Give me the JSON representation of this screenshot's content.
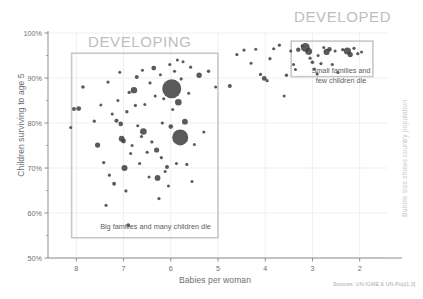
{
  "chart_data": {
    "type": "scatter",
    "title": "",
    "xlabel": "Babies per woman",
    "ylabel": "Children surviving to age 5",
    "xlim": [
      8.6,
      1.4
    ],
    "ylim": [
      50,
      100
    ],
    "x_ticks": [
      "8",
      "7",
      "6",
      "5",
      "4",
      "3",
      "2"
    ],
    "x_tick_values": [
      8,
      7,
      6,
      5,
      4,
      3,
      2
    ],
    "y_ticks": [
      "50%",
      "60%",
      "70%",
      "80%",
      "90%",
      "100%"
    ],
    "y_tick_values": [
      50,
      60,
      70,
      80,
      90,
      100
    ],
    "y_minor_tick_values": [
      55,
      65,
      75,
      85,
      95
    ],
    "x_axis_inverted": true,
    "grid": "light vertical and horizontal gridlines at major ticks",
    "legend": "none",
    "bubble_encoding": "Bubble size shows country population",
    "bubble_color": "#3f3f41",
    "annotations": [
      {
        "name": "developing",
        "heading": "DEVELOPING",
        "caption": "Big families and many children die",
        "box_x_range": [
          8.1,
          5.0
        ],
        "box_y_range": [
          54.5,
          95.5
        ]
      },
      {
        "name": "developed",
        "heading": "DEVELOPED",
        "caption_line1": "Small families and",
        "caption_line2": "few children die",
        "box_x_range": [
          3.45,
          1.72
        ],
        "box_y_range": [
          90.3,
          98.2
        ]
      }
    ],
    "points": [
      {
        "x": 8.05,
        "y": 83.1,
        "r": 2.0
      },
      {
        "x": 8.12,
        "y": 79.0,
        "r": 1.5
      },
      {
        "x": 7.95,
        "y": 83.2,
        "r": 2.4
      },
      {
        "x": 7.86,
        "y": 88.0,
        "r": 1.8
      },
      {
        "x": 7.62,
        "y": 80.4,
        "r": 1.6
      },
      {
        "x": 7.55,
        "y": 75.1,
        "r": 2.6
      },
      {
        "x": 7.48,
        "y": 84.0,
        "r": 1.5
      },
      {
        "x": 7.42,
        "y": 71.2,
        "r": 1.6
      },
      {
        "x": 7.37,
        "y": 61.7,
        "r": 1.6
      },
      {
        "x": 7.33,
        "y": 89.1,
        "r": 1.6
      },
      {
        "x": 7.3,
        "y": 68.4,
        "r": 1.6
      },
      {
        "x": 7.24,
        "y": 82.0,
        "r": 1.5
      },
      {
        "x": 7.2,
        "y": 66.5,
        "r": 1.9
      },
      {
        "x": 7.15,
        "y": 80.5,
        "r": 2.1
      },
      {
        "x": 7.12,
        "y": 85.0,
        "r": 1.5
      },
      {
        "x": 7.08,
        "y": 91.3,
        "r": 1.5
      },
      {
        "x": 7.06,
        "y": 79.8,
        "r": 2.3
      },
      {
        "x": 7.04,
        "y": 76.5,
        "r": 2.9
      },
      {
        "x": 7.0,
        "y": 76.0,
        "r": 2.4
      },
      {
        "x": 6.98,
        "y": 70.0,
        "r": 3.0
      },
      {
        "x": 6.95,
        "y": 64.9,
        "r": 1.6
      },
      {
        "x": 6.93,
        "y": 82.5,
        "r": 1.7
      },
      {
        "x": 6.9,
        "y": 57.3,
        "r": 1.9
      },
      {
        "x": 6.88,
        "y": 86.8,
        "r": 1.7
      },
      {
        "x": 6.85,
        "y": 73.2,
        "r": 1.5
      },
      {
        "x": 6.82,
        "y": 75.0,
        "r": 1.5
      },
      {
        "x": 6.78,
        "y": 87.3,
        "r": 3.2
      },
      {
        "x": 6.75,
        "y": 83.9,
        "r": 1.6
      },
      {
        "x": 6.72,
        "y": 90.2,
        "r": 2.0
      },
      {
        "x": 6.7,
        "y": 79.4,
        "r": 1.5
      },
      {
        "x": 6.66,
        "y": 71.0,
        "r": 1.6
      },
      {
        "x": 6.62,
        "y": 77.0,
        "r": 1.6
      },
      {
        "x": 6.6,
        "y": 91.7,
        "r": 1.5
      },
      {
        "x": 6.58,
        "y": 78.1,
        "r": 3.3
      },
      {
        "x": 6.55,
        "y": 84.1,
        "r": 1.5
      },
      {
        "x": 6.5,
        "y": 73.5,
        "r": 1.6
      },
      {
        "x": 6.46,
        "y": 68.0,
        "r": 1.5
      },
      {
        "x": 6.44,
        "y": 88.9,
        "r": 1.6
      },
      {
        "x": 6.4,
        "y": 75.8,
        "r": 1.6
      },
      {
        "x": 6.36,
        "y": 92.2,
        "r": 2.4
      },
      {
        "x": 6.33,
        "y": 86.0,
        "r": 1.5
      },
      {
        "x": 6.3,
        "y": 74.0,
        "r": 2.6
      },
      {
        "x": 6.28,
        "y": 67.8,
        "r": 2.9
      },
      {
        "x": 6.25,
        "y": 63.2,
        "r": 1.6
      },
      {
        "x": 6.22,
        "y": 90.7,
        "r": 1.5
      },
      {
        "x": 6.2,
        "y": 72.3,
        "r": 1.6
      },
      {
        "x": 6.18,
        "y": 80.0,
        "r": 1.6
      },
      {
        "x": 6.15,
        "y": 85.4,
        "r": 1.5
      },
      {
        "x": 6.12,
        "y": 69.2,
        "r": 1.5
      },
      {
        "x": 6.08,
        "y": 70.2,
        "r": 2.0
      },
      {
        "x": 6.05,
        "y": 66.0,
        "r": 1.5
      },
      {
        "x": 6.02,
        "y": 93.0,
        "r": 1.6
      },
      {
        "x": 6.0,
        "y": 79.2,
        "r": 2.3
      },
      {
        "x": 5.98,
        "y": 87.6,
        "r": 9.5
      },
      {
        "x": 5.96,
        "y": 83.0,
        "r": 1.5
      },
      {
        "x": 5.92,
        "y": 91.5,
        "r": 1.6
      },
      {
        "x": 5.88,
        "y": 71.0,
        "r": 1.5
      },
      {
        "x": 5.86,
        "y": 94.0,
        "r": 1.5
      },
      {
        "x": 5.84,
        "y": 84.6,
        "r": 3.3
      },
      {
        "x": 5.8,
        "y": 76.8,
        "r": 8.0
      },
      {
        "x": 5.78,
        "y": 89.8,
        "r": 1.6
      },
      {
        "x": 5.74,
        "y": 93.6,
        "r": 1.5
      },
      {
        "x": 5.7,
        "y": 80.3,
        "r": 2.9
      },
      {
        "x": 5.66,
        "y": 70.8,
        "r": 1.6
      },
      {
        "x": 5.62,
        "y": 86.6,
        "r": 1.5
      },
      {
        "x": 5.58,
        "y": 92.4,
        "r": 1.6
      },
      {
        "x": 5.55,
        "y": 67.0,
        "r": 1.5
      },
      {
        "x": 5.5,
        "y": 75.2,
        "r": 1.5
      },
      {
        "x": 5.4,
        "y": 90.6,
        "r": 2.7
      },
      {
        "x": 5.3,
        "y": 78.0,
        "r": 1.5
      },
      {
        "x": 5.2,
        "y": 91.5,
        "r": 1.7
      },
      {
        "x": 5.05,
        "y": 88.0,
        "r": 1.6
      },
      {
        "x": 4.75,
        "y": 88.2,
        "r": 2.0
      },
      {
        "x": 4.6,
        "y": 95.2,
        "r": 1.6
      },
      {
        "x": 4.45,
        "y": 96.2,
        "r": 1.6
      },
      {
        "x": 4.3,
        "y": 93.3,
        "r": 1.5
      },
      {
        "x": 4.2,
        "y": 96.4,
        "r": 1.5
      },
      {
        "x": 4.1,
        "y": 90.8,
        "r": 1.6
      },
      {
        "x": 4.02,
        "y": 89.9,
        "r": 2.4
      },
      {
        "x": 3.96,
        "y": 89.4,
        "r": 1.6
      },
      {
        "x": 3.9,
        "y": 94.3,
        "r": 1.6
      },
      {
        "x": 3.82,
        "y": 96.5,
        "r": 1.6
      },
      {
        "x": 3.7,
        "y": 97.3,
        "r": 1.6
      },
      {
        "x": 3.55,
        "y": 90.6,
        "r": 1.7
      },
      {
        "x": 3.46,
        "y": 96.0,
        "r": 1.5
      },
      {
        "x": 3.4,
        "y": 93.0,
        "r": 1.5
      },
      {
        "x": 3.36,
        "y": 91.9,
        "r": 1.5
      },
      {
        "x": 3.3,
        "y": 96.3,
        "r": 2.2
      },
      {
        "x": 3.22,
        "y": 97.1,
        "r": 1.5
      },
      {
        "x": 3.15,
        "y": 96.8,
        "r": 4.4
      },
      {
        "x": 3.08,
        "y": 95.9,
        "r": 3.4
      },
      {
        "x": 3.05,
        "y": 94.4,
        "r": 1.6
      },
      {
        "x": 3.0,
        "y": 93.5,
        "r": 1.8
      },
      {
        "x": 2.96,
        "y": 92.0,
        "r": 1.6
      },
      {
        "x": 2.88,
        "y": 95.0,
        "r": 1.5
      },
      {
        "x": 2.82,
        "y": 93.2,
        "r": 1.6
      },
      {
        "x": 2.76,
        "y": 96.8,
        "r": 1.5
      },
      {
        "x": 2.7,
        "y": 95.8,
        "r": 3.1
      },
      {
        "x": 2.64,
        "y": 96.4,
        "r": 2.3
      },
      {
        "x": 2.58,
        "y": 93.0,
        "r": 1.6
      },
      {
        "x": 2.52,
        "y": 96.0,
        "r": 1.5
      },
      {
        "x": 2.46,
        "y": 91.2,
        "r": 1.5
      },
      {
        "x": 2.36,
        "y": 96.3,
        "r": 1.6
      },
      {
        "x": 2.26,
        "y": 96.0,
        "r": 3.6
      },
      {
        "x": 2.2,
        "y": 95.2,
        "r": 2.6
      },
      {
        "x": 2.12,
        "y": 96.6,
        "r": 1.6
      },
      {
        "x": 2.04,
        "y": 95.4,
        "r": 1.6
      },
      {
        "x": 1.96,
        "y": 95.8,
        "r": 1.5
      },
      {
        "x": 3.6,
        "y": 86.0,
        "r": 1.5
      },
      {
        "x": 2.9,
        "y": 90.9,
        "r": 1.6
      }
    ]
  },
  "labels": {
    "developing_heading": "DEVELOPING",
    "developed_heading": "DEVELOPED",
    "developing_caption": "Big families and many children die",
    "developed_caption_line1": "Small families and",
    "developed_caption_line2": "few children die",
    "x_axis_title": "Babies per woman",
    "y_axis_title": "Children surviving to age 5",
    "bubble_note": "Bubble size shows country population",
    "source_note": "Sources: UN-IGME & UN-Pop[1,3]"
  },
  "colors": {
    "bubble": "#3f3f41",
    "axis": "#808285",
    "grid": "#eeeff0",
    "box": "#c7c8ca",
    "heading": "#bcbec0",
    "text": "#6d6e71",
    "faint": "#c9cacc"
  }
}
